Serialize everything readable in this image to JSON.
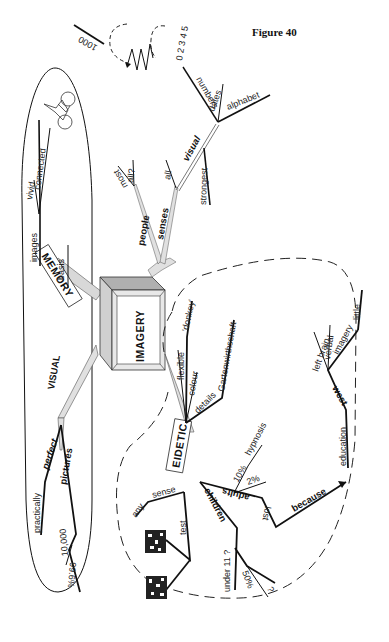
{
  "figure": {
    "title": "Figure 40"
  },
  "center": {
    "label": "IMAGERY"
  },
  "top_doodle": {
    "number": "1000",
    "digits": "0 2 3 4 5"
  },
  "memory": {
    "label": "MEMORY",
    "branches": {
      "images": "images",
      "vivid": "vivid",
      "connected": "connected",
      "basis": "basis"
    }
  },
  "visual_left": {
    "label": "VISUAL",
    "branches": {
      "perfect": "perfect",
      "practically": "practically",
      "pictures": "pictures",
      "ten_thousand": "10,000",
      "percent": "99.6%"
    }
  },
  "people": {
    "label": "people",
    "branches": {
      "most": "most",
      "all_q": "all?"
    }
  },
  "senses": {
    "label": "senses",
    "branches": {
      "all": "all",
      "visual": "visual",
      "strongest": "strongest",
      "numbers": "numbers",
      "dates": "dates",
      "alphabet": "alphabet"
    }
  },
  "eidetic": {
    "label": "EIDETIC",
    "flexible": "flexible",
    "donkey": "'donkey'",
    "colour": "colour",
    "details": "details",
    "garten": "Gartenwirthschaft",
    "any": "any",
    "sense": "sense",
    "test": "test",
    "children": "children",
    "under11": "under 11 ?",
    "fifty": "50%",
    "question": "?",
    "adults": "adults",
    "ten_pct": "10%",
    "two_pct": "2%",
    "hypnosis": "hypnosis",
    "lost": "lost",
    "because": "because",
    "education": "education",
    "west": "west",
    "left_brain": "left brain",
    "verbal": "verbal",
    "imagery": "imagery",
    "little": "little"
  }
}
